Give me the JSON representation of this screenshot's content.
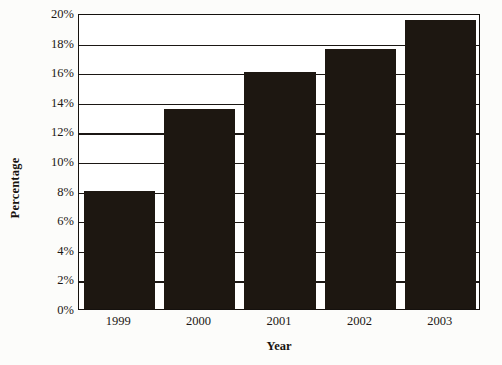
{
  "chart_data": {
    "type": "bar",
    "title": "",
    "xlabel": "Year",
    "ylabel": "Percentage",
    "categories": [
      "1999",
      "2000",
      "2001",
      "2002",
      "2003"
    ],
    "values": [
      8.0,
      13.5,
      16.0,
      17.6,
      19.5
    ],
    "value_labels": [
      "8%",
      "13.5%",
      "16%",
      "17.6%",
      "19.5%"
    ],
    "ylim": [
      0,
      20
    ],
    "ytick_values": [
      0,
      2,
      4,
      6,
      8,
      10,
      12,
      14,
      16,
      18,
      20
    ],
    "ytick_labels": [
      "0%",
      "2%",
      "4%",
      "6%",
      "8%",
      "10%",
      "12%",
      "14%",
      "16%",
      "18%",
      "20%"
    ],
    "grid": true,
    "grid_axis": "y",
    "legend": false,
    "legend_position": "none",
    "bar_color": "#1d1711",
    "plot_background": "#ffffff",
    "axis_color": "#15110e"
  },
  "axis": {
    "x_title": "Year",
    "y_title": "Percentage"
  }
}
